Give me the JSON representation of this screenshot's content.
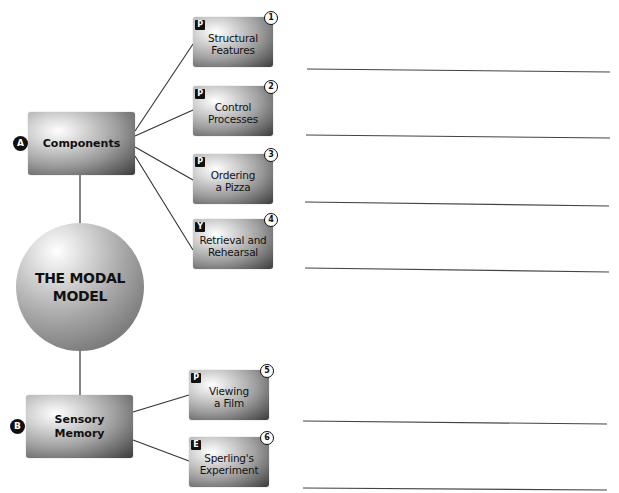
{
  "diagram": {
    "center": {
      "label": "THE MODAL\nMODEL"
    },
    "branches": [
      {
        "badge": "A",
        "label": "Components",
        "children": [
          {
            "tag": "P",
            "number": "1",
            "label": "Structural\nFeatures"
          },
          {
            "tag": "P",
            "number": "2",
            "label": "Control\nProcesses"
          },
          {
            "tag": "P",
            "number": "3",
            "label": "Ordering\na Pizza"
          },
          {
            "tag": "Y",
            "number": "4",
            "label": "Retrieval and\nRehearsal"
          }
        ]
      },
      {
        "badge": "B",
        "label": "Sensory\nMemory",
        "children": [
          {
            "tag": "P",
            "number": "5",
            "label": "Viewing\na Film"
          },
          {
            "tag": "E",
            "number": "6",
            "label": "Sperling's\nExperiment"
          }
        ]
      }
    ],
    "answer_lines_count": 6
  },
  "colors": {
    "line": "#333333",
    "badge": "#111111",
    "background": "#ffffff"
  }
}
